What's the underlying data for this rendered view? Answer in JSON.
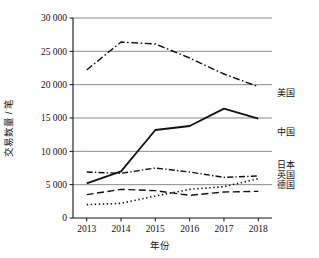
{
  "chart_data": {
    "type": "line",
    "title": "",
    "xlabel": "年份",
    "ylabel": "交易数量 / 笔",
    "categories": [
      "2013",
      "2014",
      "2015",
      "2016",
      "2017",
      "2018"
    ],
    "x": [
      2013,
      2014,
      2015,
      2016,
      2017,
      2018
    ],
    "xlim": [
      2012.6,
      2018.4
    ],
    "ylim": [
      0,
      30000
    ],
    "yticks": [
      0,
      5000,
      10000,
      15000,
      20000,
      25000,
      30000
    ],
    "ytick_labels": [
      "0",
      "5 000",
      "10 000",
      "15 000",
      "20 000",
      "25 000",
      "30 000"
    ],
    "grid": true,
    "grid_axis": "y",
    "legend_position": "right-inline",
    "series": [
      {
        "name": "美国",
        "label": "美国",
        "style": "dash-dot",
        "color": "#111111",
        "values": [
          22200,
          26400,
          26100,
          24000,
          21600,
          19700
        ]
      },
      {
        "name": "中国",
        "label": "中国",
        "style": "solid",
        "color": "#111111",
        "values": [
          5200,
          7000,
          13200,
          13800,
          16400,
          14900
        ]
      },
      {
        "name": "日本",
        "label": "日本",
        "style": "dash-dot-thin",
        "color": "#111111",
        "values": [
          6900,
          6700,
          7500,
          6900,
          6100,
          6300
        ]
      },
      {
        "name": "英国",
        "label": "英国",
        "style": "dotted",
        "color": "#111111",
        "values": [
          2000,
          2200,
          3300,
          4300,
          4700,
          5900
        ]
      },
      {
        "name": "德国",
        "label": "德国",
        "style": "dashed",
        "color": "#111111",
        "values": [
          3500,
          4300,
          4100,
          3400,
          3900,
          4000
        ]
      }
    ]
  }
}
